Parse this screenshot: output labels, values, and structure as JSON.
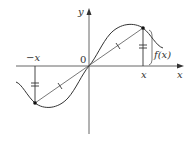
{
  "diagram": {
    "axes": {
      "x_label": "x",
      "y_label": "y",
      "origin_label": "0"
    },
    "points": [
      {
        "name": "point-x",
        "axis_label": "x",
        "description": "(x, f(x))"
      },
      {
        "name": "point-neg-x",
        "axis_label": "−x",
        "description": "(−x, −f(x))"
      }
    ],
    "annotations": {
      "height_label": "f(x)",
      "equal_length_marks": "double tick marks on vertical segments",
      "chord_midpoint_marks": "single tick marks on the two halves of the chord through the origin"
    },
    "colors": {
      "ink": "#333333",
      "background": "#ffffff"
    }
  }
}
